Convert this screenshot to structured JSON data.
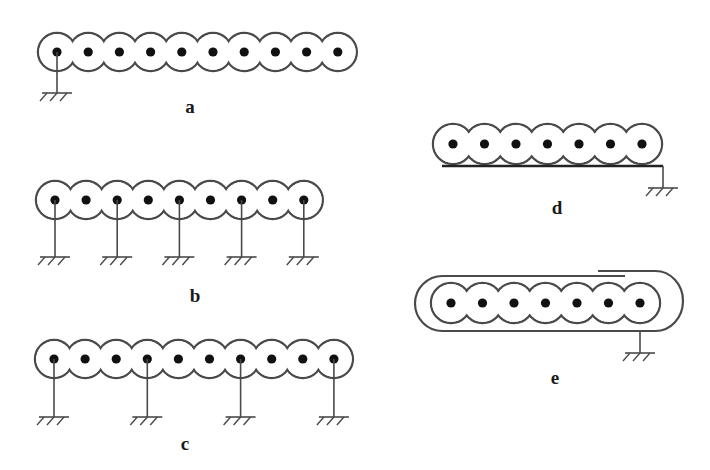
{
  "figure": {
    "style": {
      "stroke": "#4a4a4a",
      "dot": "#111111",
      "background": "#ffffff"
    },
    "panels": [
      {
        "id": "a",
        "label": "a",
        "conductors": 10,
        "x0": 57,
        "dx": 31.2,
        "y": 52,
        "r": 19,
        "grounded": [
          0
        ],
        "ground_y": 93,
        "label_pos": [
          190,
          107
        ]
      },
      {
        "id": "b",
        "label": "b",
        "conductors": 9,
        "x0": 55,
        "dx": 31.1,
        "y": 200,
        "r": 19,
        "grounded": [
          0,
          2,
          4,
          6,
          8
        ],
        "ground_y": 257,
        "label_pos": [
          195,
          296
        ]
      },
      {
        "id": "c",
        "label": "c",
        "conductors": 10,
        "x0": 54,
        "dx": 31.1,
        "y": 359,
        "r": 19,
        "grounded": [
          0,
          3,
          6,
          9
        ],
        "ground_y": 417,
        "label_pos": [
          185,
          444
        ]
      },
      {
        "id": "d",
        "label": "d",
        "conductors": 7,
        "x0": 453,
        "dx": 31.5,
        "y": 144,
        "r": 20,
        "ground_plane": {
          "y": 166,
          "x1": 442,
          "x2": 663
        },
        "ground_y": 188,
        "label_pos": [
          557,
          208
        ]
      },
      {
        "id": "e",
        "label": "e",
        "conductors": 7,
        "x0": 451,
        "dx": 31.5,
        "y": 303,
        "r": 20,
        "shield": {
          "left": 415,
          "right": 683,
          "top": 276,
          "bottom": 331,
          "inner_end": 625,
          "outer_start": 598,
          "outer_top": 271
        },
        "ground_x": 640,
        "ground_y": 353,
        "label_pos": [
          555,
          378
        ]
      }
    ]
  }
}
